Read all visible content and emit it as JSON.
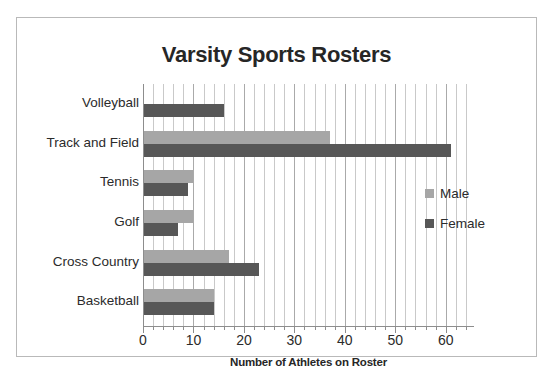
{
  "chart_data": {
    "type": "bar",
    "orientation": "horizontal",
    "title": "Varsity Sports Rosters",
    "xlabel": "Number of Athletes on Roster",
    "ylabel": "",
    "xlim": [
      0,
      65
    ],
    "xticks": [
      0,
      10,
      20,
      30,
      40,
      50,
      60
    ],
    "xtick_labels": [
      "0",
      "10",
      "20",
      "30",
      "40",
      "50",
      "60"
    ],
    "minor_tick_step": 2,
    "grid": "vertical",
    "legend_position": "right",
    "categories": [
      "Volleyball",
      "Track and Field",
      "Tennis",
      "Golf",
      "Cross Country",
      "Basketball"
    ],
    "series": [
      {
        "name": "Male",
        "color": "#a6a6a6",
        "values": [
          0,
          37,
          10,
          10,
          17,
          14
        ]
      },
      {
        "name": "Female",
        "color": "#575757",
        "values": [
          16,
          61,
          9,
          7,
          23,
          14
        ]
      }
    ]
  },
  "legend": {
    "entries": [
      {
        "label": "Male",
        "swatch": "male"
      },
      {
        "label": "Female",
        "swatch": "female"
      }
    ]
  },
  "colors": {
    "male": "#a6a6a6",
    "female": "#575757",
    "axis": "#8d8d8d",
    "grid": "#c9c9c9",
    "border": "#b9b9b9",
    "text": "#2b2b2b"
  }
}
